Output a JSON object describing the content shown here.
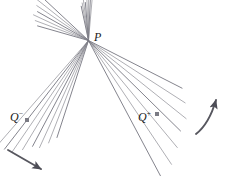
{
  "figure": {
    "kind": "geometry-diagram",
    "background_color": "#ffffff",
    "line_color": "#8c8c94",
    "dark_line_color": "#6e6e78",
    "arrow_color": "#57575f",
    "label_color": "#1a1a1a",
    "labels": {
      "center_point": "P",
      "q_minus_base": "Q",
      "q_minus_sign": "−",
      "q_plus_base": "Q",
      "q_plus_sign": "+"
    },
    "markers": [
      {
        "name": "q-minus-marker",
        "x": 27,
        "y": 120,
        "size": 4
      },
      {
        "name": "q-plus-marker",
        "x": 157,
        "y": 114,
        "size": 4
      }
    ],
    "center": {
      "x": 88.5,
      "y": 40.5
    },
    "fans": [
      {
        "name": "upper-left-fan",
        "count": 7,
        "angle_start": 196,
        "angle_end": 223,
        "length_min": 56,
        "length_max": 66
      },
      {
        "name": "upper-fan",
        "count": 8,
        "angle_start": 258,
        "angle_end": 275,
        "length_min": 38,
        "length_max": 44
      },
      {
        "name": "lower-left-fan",
        "count": 8,
        "angle_start": 108,
        "angle_end": 131,
        "length_min": 105,
        "length_max": 145
      },
      {
        "name": "lower-right-fan",
        "count": 7,
        "angle_start": 27,
        "angle_end": 62,
        "length_min": 108,
        "length_max": 155
      }
    ],
    "arrows": [
      {
        "name": "lower-left-direction-arrow",
        "start": {
          "x": 8,
          "y": 150
        },
        "control": {
          "x": 22,
          "y": 158
        },
        "end": {
          "x": 41,
          "y": 169
        }
      },
      {
        "name": "lower-right-direction-arrow",
        "start": {
          "x": 196,
          "y": 134
        },
        "control": {
          "x": 209,
          "y": 124
        },
        "end": {
          "x": 216,
          "y": 100
        }
      }
    ]
  }
}
